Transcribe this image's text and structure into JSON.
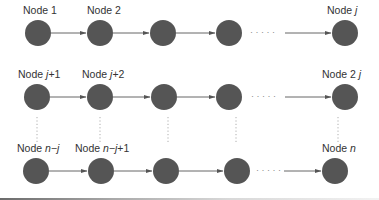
{
  "diagram": {
    "type": "node-grid",
    "colors": {
      "node_fill": "#555555",
      "arrow": "#555555",
      "dots": "#999999",
      "label": "#333333"
    },
    "rows": [
      {
        "y": 33,
        "label_y": 14,
        "nodes": [
          {
            "x": 38,
            "label_prefix": "Node ",
            "label_var": "",
            "label_suffix": "1",
            "label_x": 23
          },
          {
            "x": 100,
            "label_prefix": "Node ",
            "label_var": "",
            "label_suffix": "2",
            "label_x": 87
          },
          {
            "x": 163,
            "label_prefix": "",
            "label_var": "",
            "label_suffix": ""
          },
          {
            "x": 229,
            "label_prefix": "",
            "label_var": "",
            "label_suffix": ""
          },
          {
            "x": 345,
            "label_prefix": "Node ",
            "label_var": "j",
            "label_suffix": "",
            "label_x": 326
          }
        ]
      },
      {
        "y": 97,
        "label_y": 77,
        "nodes": [
          {
            "x": 37,
            "label_prefix": "Node ",
            "label_var": "j",
            "label_suffix": "+1",
            "label_x": 17
          },
          {
            "x": 100,
            "label_prefix": "Node ",
            "label_var": "j",
            "label_suffix": "+2",
            "label_x": 82
          },
          {
            "x": 164,
            "label_prefix": "",
            "label_var": "",
            "label_suffix": ""
          },
          {
            "x": 229,
            "label_prefix": "",
            "label_var": "",
            "label_suffix": ""
          },
          {
            "x": 345,
            "label_prefix": "Node 2 ",
            "label_var": "j",
            "label_suffix": "",
            "label_x": 322
          }
        ]
      },
      {
        "y": 171,
        "label_y": 152,
        "nodes": [
          {
            "x": 36,
            "label_prefix": "Node ",
            "label_var": "n−j",
            "label_suffix": "",
            "label_x": 17
          },
          {
            "x": 101,
            "label_prefix": "Node ",
            "label_var": "n−j",
            "label_suffix": "+1",
            "label_x": 75
          },
          {
            "x": 166,
            "label_prefix": "",
            "label_var": "",
            "label_suffix": ""
          },
          {
            "x": 237,
            "label_prefix": "",
            "label_var": "",
            "label_suffix": ""
          },
          {
            "x": 335,
            "label_prefix": "Node ",
            "label_var": "n",
            "label_suffix": "",
            "label_x": 322
          }
        ]
      }
    ],
    "ellipsis": "· · · · ·",
    "labels": {
      "r0n0": "Node 1",
      "r0n1": "Node 2",
      "r0n4_prefix": "Node ",
      "r0n4_var": "j",
      "r1n0_prefix": "Node ",
      "r1n0_var": "j",
      "r1n0_suffix": "+1",
      "r1n1_prefix": "Node ",
      "r1n1_var": "j",
      "r1n1_suffix": "+2",
      "r1n4_prefix": "Node 2 ",
      "r1n4_var": "j",
      "r2n0_prefix": "Node ",
      "r2n0_var": "n−j",
      "r2n1_prefix": "Node ",
      "r2n1_var": "n−j",
      "r2n1_suffix": "+1",
      "r2n4_prefix": "Node ",
      "r2n4_var": "n"
    }
  }
}
